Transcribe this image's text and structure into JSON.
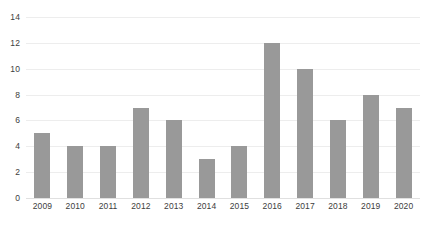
{
  "chart_data": {
    "type": "bar",
    "title": "",
    "subtitle": "",
    "xlabel": "",
    "ylabel": "",
    "categories": [
      "2009",
      "2010",
      "2011",
      "2012",
      "2013",
      "2014",
      "2015",
      "2016",
      "2017",
      "2018",
      "2019",
      "2020"
    ],
    "values": [
      5,
      4,
      4,
      7,
      6,
      3,
      4,
      12,
      10,
      6,
      8,
      7
    ],
    "series": [
      {
        "name": "",
        "values": [
          5,
          4,
          4,
          7,
          6,
          3,
          4,
          12,
          10,
          6,
          8,
          7
        ]
      }
    ],
    "ylim": [
      0,
      14
    ],
    "ytick_values": [
      0,
      2,
      4,
      6,
      8,
      10,
      12,
      14
    ],
    "ytick_labels": [
      "0",
      "2",
      "4",
      "6",
      "8",
      "10",
      "12",
      "14"
    ],
    "ytick_step": 2,
    "xtick_labels": [
      "2009",
      "2010",
      "2011",
      "2012",
      "2013",
      "2014",
      "2015",
      "2016",
      "2017",
      "2018",
      "2019",
      "2020"
    ],
    "grid": true,
    "grid_axis": "y",
    "legend": false,
    "legend_position": "none",
    "annotations": [],
    "data_labels": false,
    "colors": {
      "bar": "#999999",
      "gridline": "#ededed",
      "baseline": "#e0e0e0",
      "tick_label": "#3d3d3d",
      "background": "#ffffff"
    }
  }
}
